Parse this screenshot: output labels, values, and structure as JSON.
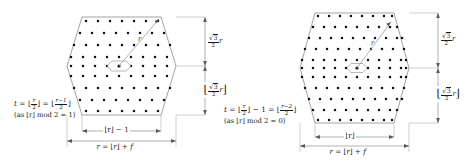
{
  "figure": {
    "type": "lattice-hexagon-diagram",
    "background": "#ffffff",
    "ink": "#1a1a1a",
    "line_color": "#8a8a8a",
    "dot_color": "#111111",
    "panels": [
      {
        "id": "left",
        "parity_case": "odd",
        "formula": "t = ⌊r/2⌋ = ⌊(r−1)/2⌋",
        "formula_parts": {
          "lhs": "t",
          "eq1": "=",
          "mid_num": "r",
          "mid_den": "2",
          "eq2": "=",
          "right_num": "r−1",
          "right_den": "2"
        },
        "condition": "(as ⌊r⌋ mod 2 = 1)",
        "bottom_inner_label": "⌊r⌋ − 1",
        "bottom_outer_label": "r = ⌊r⌋ + f",
        "vertical_upper_label": "√3/2 r",
        "vertical_lower_label": "⌊√3/2 r⌋",
        "radius_label": "r",
        "grid_cols": 9,
        "grid_rows": 9
      },
      {
        "id": "right",
        "parity_case": "even",
        "formula": "t = ⌊r/2⌋ − 1 = ⌊(r−2)/2⌋",
        "formula_parts": {
          "lhs": "t",
          "eq1": "=",
          "mid_num": "r",
          "mid_den": "2",
          "minus": "− 1",
          "eq2": "=",
          "right_num": "r−2",
          "right_den": "2"
        },
        "condition": "(as ⌊r⌋ mod 2 = 0)",
        "bottom_inner_label": "⌊r⌋",
        "bottom_outer_label": "r = ⌊r⌋ + f",
        "vertical_upper_label": "√3/2 r",
        "vertical_lower_label": "⌊√3/2 r⌋",
        "radius_label": "r",
        "grid_cols": 11,
        "grid_rows": 11
      }
    ],
    "symbols": {
      "floor_open": "⌊",
      "floor_close": "⌋",
      "sqrt": "√",
      "three": "3",
      "two": "2",
      "minus": "−",
      "equals": "=",
      "plus": "+",
      "var_r": "r",
      "var_t": "t",
      "var_f": "f",
      "mod": "mod",
      "as": "as"
    }
  }
}
